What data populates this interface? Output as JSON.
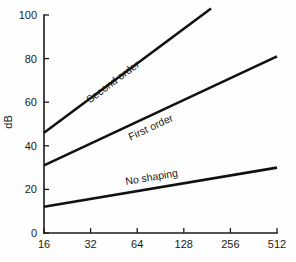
{
  "chart_data": {
    "type": "line",
    "title": "",
    "xlabel": "",
    "ylabel": "dB",
    "x_scale": "log2",
    "x_ticks": [
      16,
      32,
      64,
      128,
      256,
      512
    ],
    "x_tick_labels": [
      "16",
      "32",
      "64",
      "128",
      "256",
      "512"
    ],
    "xlim": [
      16,
      512
    ],
    "y_ticks": [
      0,
      20,
      40,
      60,
      80,
      100
    ],
    "y_tick_labels": [
      "0",
      "20",
      "40",
      "60",
      "80",
      "100"
    ],
    "ylim": [
      0,
      100
    ],
    "grid": false,
    "legend": "inline-labels-along-curves",
    "series": [
      {
        "name": "Second order",
        "label": "Second order",
        "x": [
          16,
          192
        ],
        "values": [
          46,
          103
        ],
        "slope_db_per_octave": 15.9,
        "label_x": 46,
        "label_y": 68
      },
      {
        "name": "First order",
        "label": "First order",
        "x": [
          16,
          512
        ],
        "values": [
          31,
          81
        ],
        "slope_db_per_octave": 10,
        "label_x": 80,
        "label_y": 47
      },
      {
        "name": "No shaping",
        "label": "No shaping",
        "x": [
          16,
          512
        ],
        "values": [
          12,
          30
        ],
        "slope_db_per_octave": 3.6,
        "label_x": 80,
        "label_y": 24
      }
    ]
  },
  "geometry": {
    "plot_left": 44,
    "plot_right": 277,
    "plot_top": 15,
    "plot_bottom": 233,
    "tick_len": 5
  },
  "colors": {
    "background": "#fefefe",
    "axis": "#1a1a1a",
    "line": "#111111",
    "text": "#1a1a1a"
  }
}
